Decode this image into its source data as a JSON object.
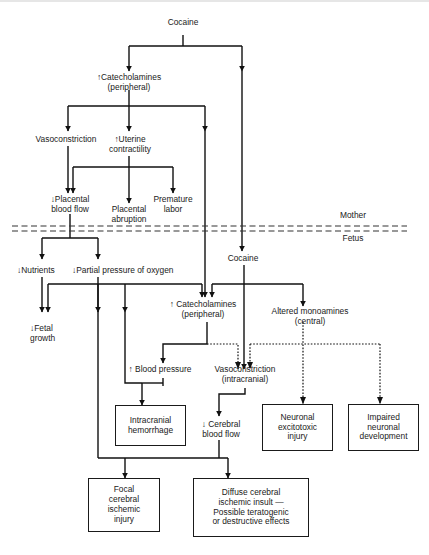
{
  "diagram": {
    "title": "",
    "nodes": {
      "cocaine_mother": "Cocaine",
      "catecholamines_peripheral_mother": "↑Catecholamines\n(peripheral)",
      "vasoconstriction": "Vasoconstriction",
      "uterine_contractility": "↑Uterine\ncontractility",
      "placental_blood_flow": "↓Placental\nblood flow",
      "placental_abruption": "Placental\nabruption",
      "premature_labor": "Premature\nlabor",
      "mother_label": "Mother",
      "fetus_label": "Fetus",
      "cocaine_fetus": "Cocaine",
      "nutrients": "↓Nutrients",
      "partial_pressure_oxygen": "↓Partial pressure of oxygen",
      "fetal_growth": "↓Fetal\ngrowth",
      "catecholamines_peripheral_fetus": "↑ Catecholamines\n(peripheral)",
      "altered_monoamines": "Altered monoamines\n(central)",
      "blood_pressure": "↑ Blood pressure",
      "vasoconstriction_intracranial": "Vasoconstriction\n(intracranial)",
      "cerebral_blood_flow": "↓ Cerebral\nblood flow",
      "intracranial_hemorrhage": "Intracranial\nhemorrhage",
      "neuronal_excitotoxic_injury": "Neuronal\nexcitotoxic\ninjury",
      "impaired_neuronal_development": "Impaired\nneuronal\ndevelopment",
      "focal_cerebral_ischemic_injury": "Focal\ncerebral\nischemic\ninjury",
      "diffuse_cerebral_ischemic_insult": "Diffuse cerebral\nischemic insult —\nPossible teratogenic\nor destructive effects"
    },
    "edges": [
      {
        "from": "Cocaine (mother)",
        "to": "↑Catecholamines (peripheral)",
        "style": "solid"
      },
      {
        "from": "Cocaine (mother)",
        "to": "Cocaine (fetus)",
        "style": "solid"
      },
      {
        "from": "↑Catecholamines (peripheral)",
        "to": "Vasoconstriction",
        "style": "solid"
      },
      {
        "from": "↑Catecholamines (peripheral)",
        "to": "↑Uterine contractility",
        "style": "solid"
      },
      {
        "from": "↑Catecholamines (peripheral)",
        "to": "↑ Catecholamines (peripheral, fetus)",
        "style": "solid"
      },
      {
        "from": "Vasoconstriction",
        "to": "↓Placental blood flow",
        "style": "solid"
      },
      {
        "from": "↑Uterine contractility",
        "to": "↓Placental blood flow",
        "style": "solid"
      },
      {
        "from": "↑Uterine contractility",
        "to": "Placental abruption",
        "style": "solid"
      },
      {
        "from": "↑Uterine contractility",
        "to": "Premature labor",
        "style": "solid"
      },
      {
        "from": "↓Placental blood flow",
        "to": "↓Nutrients",
        "style": "solid"
      },
      {
        "from": "↓Placental blood flow",
        "to": "↓Partial pressure of oxygen",
        "style": "solid"
      },
      {
        "from": "↓Nutrients",
        "to": "↓Fetal growth",
        "style": "solid"
      },
      {
        "from": "↓Partial pressure of oxygen",
        "to": "↓Fetal growth",
        "style": "solid"
      },
      {
        "from": "↓Partial pressure of oxygen",
        "to": "↑ Catecholamines (peripheral, fetus)",
        "style": "solid"
      },
      {
        "from": "↓Partial pressure of oxygen",
        "to": "Intracranial hemorrhage",
        "style": "solid"
      },
      {
        "from": "↓Partial pressure of oxygen",
        "to": "Focal cerebral ischemic injury",
        "style": "solid"
      },
      {
        "from": "Cocaine (fetus)",
        "to": "↑ Catecholamines (peripheral, fetus)",
        "style": "solid"
      },
      {
        "from": "Cocaine (fetus)",
        "to": "Altered monoamines (central)",
        "style": "solid"
      },
      {
        "from": "Cocaine (fetus)",
        "to": "Vasoconstriction (intracranial)",
        "style": "solid"
      },
      {
        "from": "↑ Catecholamines (peripheral, fetus)",
        "to": "↑ Blood pressure",
        "style": "solid"
      },
      {
        "from": "↑ Catecholamines (peripheral, fetus)",
        "to": "Vasoconstriction (intracranial)",
        "style": "dotted"
      },
      {
        "from": "Altered monoamines (central)",
        "to": "Vasoconstriction (intracranial)",
        "style": "dotted"
      },
      {
        "from": "Altered monoamines (central)",
        "to": "Neuronal excitotoxic injury",
        "style": "dotted"
      },
      {
        "from": "Altered monoamines (central)",
        "to": "Impaired neuronal development",
        "style": "dotted"
      },
      {
        "from": "↑ Blood pressure",
        "to": "Intracranial hemorrhage",
        "style": "solid"
      },
      {
        "from": "Vasoconstriction (intracranial)",
        "to": "↓ Cerebral blood flow",
        "style": "solid"
      },
      {
        "from": "↓ Cerebral blood flow",
        "to": "Focal cerebral ischemic injury",
        "style": "solid"
      },
      {
        "from": "↓ Cerebral blood flow",
        "to": "Diffuse cerebral ischemic insult",
        "style": "solid"
      }
    ]
  }
}
